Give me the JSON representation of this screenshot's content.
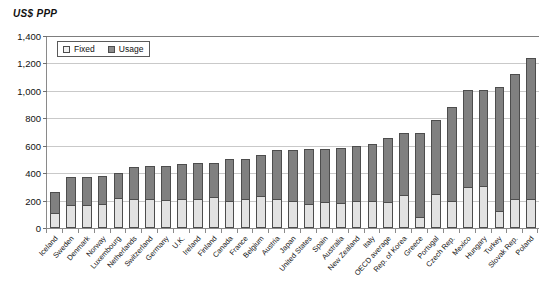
{
  "chart_data": {
    "type": "bar",
    "stacked": true,
    "title": "",
    "subtitle": "",
    "xlabel": "",
    "ylabel": "US$ PPP",
    "ylim": [
      0,
      1400
    ],
    "ytick_step": 200,
    "ytick_labels": [
      "1,400",
      "1,200",
      "1,000",
      "800",
      "600",
      "400",
      "200",
      "0"
    ],
    "ytick_values": [
      1400,
      1200,
      1000,
      800,
      600,
      400,
      200,
      0
    ],
    "grid": true,
    "legend_position": "top-left-inside",
    "legend": [
      "Fixed",
      "Usage"
    ],
    "categories": [
      "Iceland",
      "Sweden",
      "Denmark",
      "Norway",
      "Luxembourg",
      "Netherlands",
      "Switzerland",
      "Germany",
      "U.K.",
      "Ireland",
      "Finland",
      "Canada",
      "France",
      "Belgium",
      "Austria",
      "Japan",
      "United States",
      "Spain",
      "Australia",
      "New Zealand",
      "Italy",
      "OECD average",
      "Rep. of Korea",
      "Greece",
      "Portugal",
      "Czech Rep.",
      "Mexico",
      "Hungary",
      "Turkey",
      "Slovak Rep.",
      "Poland"
    ],
    "series": [
      {
        "name": "Fixed",
        "color": "#e2e2e2",
        "values": [
          110,
          165,
          170,
          175,
          220,
          215,
          210,
          205,
          215,
          215,
          225,
          195,
          215,
          230,
          215,
          200,
          175,
          190,
          185,
          200,
          195,
          190,
          240,
          80,
          245,
          200,
          300,
          305,
          125,
          215,
          215
        ]
      },
      {
        "name": "Usage",
        "color": "#808080",
        "values": [
          155,
          205,
          200,
          205,
          180,
          230,
          245,
          250,
          255,
          260,
          250,
          305,
          290,
          300,
          355,
          370,
          400,
          385,
          395,
          395,
          415,
          470,
          455,
          615,
          545,
          685,
          710,
          700,
          900,
          905,
          1025
        ]
      }
    ],
    "totals": [
      265,
      370,
      370,
      380,
      400,
      445,
      455,
      455,
      470,
      475,
      475,
      500,
      505,
      530,
      570,
      570,
      575,
      575,
      580,
      595,
      610,
      660,
      695,
      695,
      790,
      885,
      1010,
      1005,
      1025,
      1120,
      1240
    ]
  }
}
